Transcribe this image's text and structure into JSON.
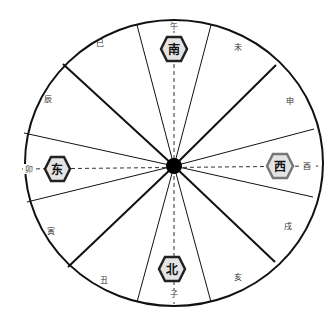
{
  "diagram": {
    "center": {
      "x": 174,
      "y": 166
    },
    "radius": {
      "rx": 149,
      "ry": 143
    },
    "hub_radius": 8,
    "colors": {
      "outline": "#111111",
      "hex_fill": "#e4e4e4",
      "hex_border_dark": "#222222",
      "hex_border_gray": "#777777",
      "dashed": "#333333"
    },
    "branches": [
      {
        "label": "午",
        "angle": 0
      },
      {
        "label": "未",
        "angle": 30
      },
      {
        "label": "申",
        "angle": 60
      },
      {
        "label": "酉",
        "angle": 90
      },
      {
        "label": "戌",
        "angle": 120
      },
      {
        "label": "亥",
        "angle": 150
      },
      {
        "label": "子",
        "angle": 180
      },
      {
        "label": "丑",
        "angle": 210
      },
      {
        "label": "寅",
        "angle": 240
      },
      {
        "label": "卯",
        "angle": 270
      },
      {
        "label": "辰",
        "angle": 300
      },
      {
        "label": "巳",
        "angle": 330
      }
    ],
    "directions": {
      "south": {
        "label": "南",
        "border": "dark"
      },
      "west": {
        "label": "西",
        "border": "gray"
      },
      "north": {
        "label": "北",
        "border": "dark"
      },
      "east": {
        "label": "东",
        "border": "dark"
      }
    }
  }
}
